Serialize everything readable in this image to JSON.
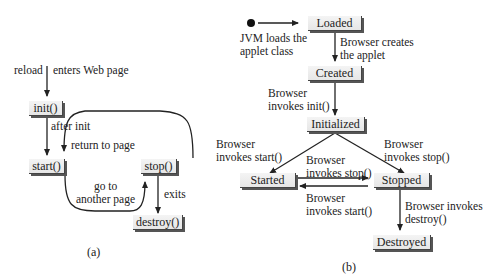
{
  "diagram_a": {
    "caption": "(a)",
    "states": {
      "init": "init()",
      "start": "start()",
      "stop": "stop()",
      "destroy": "destroy()"
    },
    "labels": {
      "reload": "reload",
      "enters": "enters Web page",
      "after_init": "after init",
      "return_to_page": "return to page",
      "go_to": "go to\nanother page",
      "exits": "exits"
    }
  },
  "diagram_b": {
    "caption": "(b)",
    "states": {
      "loaded": "Loaded",
      "created": "Created",
      "initialized": "Initialized",
      "started": "Started",
      "stopped": "Stopped",
      "destroyed": "Destroyed"
    },
    "labels": {
      "jvm_loads": "JVM loads the\napplet class",
      "browser_creates": "Browser creates\nthe applet",
      "invokes_init": "Browser\ninvokes init()",
      "invokes_start_left": "Browser\ninvokes start()",
      "invokes_stop_right": "Browser\ninvokes stop()",
      "invokes_stop_mid": "Browser\ninvokes stop()",
      "invokes_start_mid": "Browser\ninvokes start()",
      "invokes_destroy": "Browser invokes\ndestroy()"
    }
  },
  "colors": {
    "line": "#222222",
    "box_fill": "#ececec",
    "box_shadow": "#555555"
  }
}
